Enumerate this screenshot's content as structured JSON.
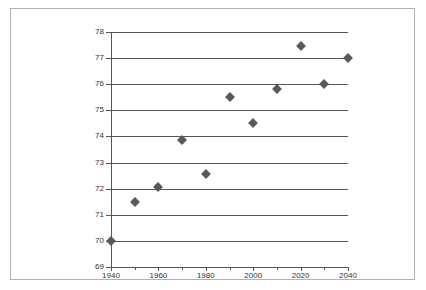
{
  "chart_data": {
    "type": "scatter",
    "title": "",
    "subtitle": "",
    "xlabel": "",
    "ylabel": "",
    "xlim": [
      1940,
      2040
    ],
    "ylim": [
      69,
      78
    ],
    "grid": "horizontal",
    "legend": "none",
    "marker": "diamond",
    "marker_color": "#595959",
    "axis_color": "#555555",
    "frame_color": "#b0b0b0",
    "x": [
      1940,
      1950,
      1960,
      1970,
      1980,
      1990,
      2000,
      2010,
      2020,
      2030,
      2040
    ],
    "values": [
      70.0,
      71.5,
      72.05,
      73.85,
      72.55,
      75.5,
      74.5,
      75.83,
      77.45,
      76.0,
      77.0
    ],
    "points": [
      {
        "x": 1940,
        "y": 70.0
      },
      {
        "x": 1950,
        "y": 71.5
      },
      {
        "x": 1960,
        "y": 72.05
      },
      {
        "x": 1970,
        "y": 73.85
      },
      {
        "x": 1980,
        "y": 72.55
      },
      {
        "x": 1990,
        "y": 75.5
      },
      {
        "x": 2000,
        "y": 74.5
      },
      {
        "x": 2010,
        "y": 75.83
      },
      {
        "x": 2020,
        "y": 77.45
      },
      {
        "x": 2030,
        "y": 76.0
      },
      {
        "x": 2040,
        "y": 77.0
      }
    ],
    "yticks": [
      69,
      70,
      71,
      72,
      73,
      74,
      75,
      76,
      77,
      78
    ],
    "ytick_labels": [
      "69",
      "70",
      "71",
      "72",
      "73",
      "74",
      "75",
      "76",
      "77",
      "78"
    ],
    "xticks": [
      1940,
      1950,
      1960,
      1970,
      1980,
      1990,
      2000,
      2010,
      2020,
      2030,
      2040
    ],
    "xtick_labels": [
      "1940",
      "",
      "1960",
      "",
      "1980",
      "",
      "2000",
      "",
      "2020",
      "",
      "2040"
    ],
    "xticks_labeled": [
      1940,
      1960,
      1980,
      2000,
      2020,
      2040
    ]
  }
}
